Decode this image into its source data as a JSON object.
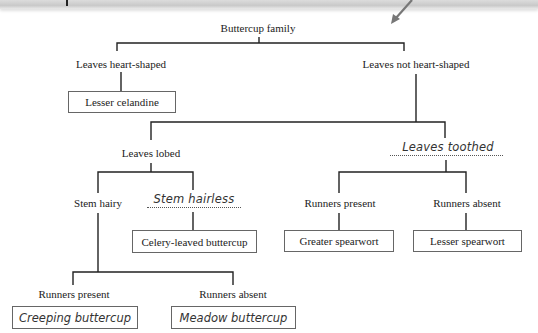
{
  "diagram": {
    "type": "dichotomous-key",
    "root": {
      "label": "Buttercup family"
    },
    "level1": {
      "left": {
        "label": "Leaves heart-shaped",
        "result": "Lesser celandine"
      },
      "right": {
        "label": "Leaves not heart-shaped"
      }
    },
    "level2": {
      "left": {
        "label": "Leaves lobed"
      },
      "right": {
        "label": "Leaves toothed",
        "handwritten": true
      }
    },
    "lobed_branch": {
      "left": {
        "label": "Stem hairy"
      },
      "right": {
        "label": "Stem hairless",
        "handwritten": true,
        "result": "Celery-leaved buttercup"
      }
    },
    "toothed_branch": {
      "left": {
        "label": "Runners present",
        "result": "Greater spearwort"
      },
      "right": {
        "label": "Runners absent",
        "result": "Lesser spearwort"
      }
    },
    "hairy_branch": {
      "left": {
        "label": "Runners present",
        "result": "Creeping buttercup",
        "handwritten": true
      },
      "right": {
        "label": "Runners absent",
        "result": "Meadow buttercup",
        "handwritten": true
      }
    }
  },
  "colors": {
    "line": "#222222",
    "box_border": "#666666",
    "background": "#ffffff",
    "topbar": "#cccccc",
    "arrow": "#666666"
  }
}
